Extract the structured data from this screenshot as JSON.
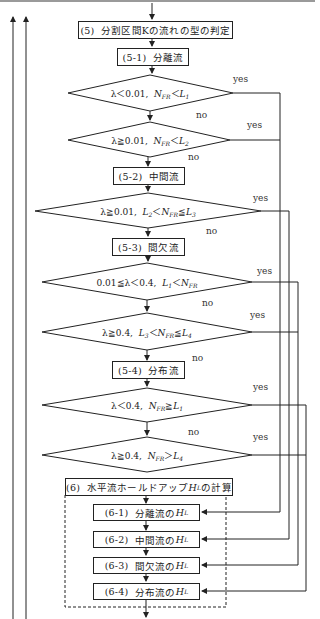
{
  "title_box": {
    "num": "(5)",
    "label": "分割区間Kの流れの型の判定"
  },
  "steps": {
    "s5_1": {
      "num": "(5-1)",
      "label": "分離流"
    },
    "s5_2": {
      "num": "(5-2)",
      "label": "中間流"
    },
    "s5_3": {
      "num": "(5-3)",
      "label": "間欠流"
    },
    "s5_4": {
      "num": "(5-4)",
      "label": "分布流"
    }
  },
  "decisions": [
    {
      "id": "d1",
      "text": "λ＜0.01,  N_FR＜L_1",
      "pre": "λ＜0.01,",
      "var1": "N",
      "sub1": "FR",
      "op": "＜",
      "var2": "L",
      "sub2": "1",
      "yes": "yes",
      "no": "no"
    },
    {
      "id": "d2",
      "text": "λ≧0.01,  N_FR＜L_2",
      "pre": "λ≧0.01,",
      "var1": "N",
      "sub1": "FR",
      "op": "＜",
      "var2": "L",
      "sub2": "2",
      "yes": "yes",
      "no": "no"
    },
    {
      "id": "d3",
      "text": "λ≧0.01,  L_2＜N_FR≦L_3",
      "pre": "λ≧0.01,",
      "var1": "L",
      "sub1": "2",
      "op": "＜",
      "var2": "N",
      "sub2": "FR",
      "op2": "≦",
      "var3": "L",
      "sub3": "3",
      "yes": "yes",
      "no": "no"
    },
    {
      "id": "d4",
      "text": "0.01≦λ＜0.4,  L_1＜N_FR",
      "pre": "0.01≦λ＜0.4,",
      "var1": "L",
      "sub1": "1",
      "op": "＜",
      "var2": "N",
      "sub2": "FR",
      "yes": "yes",
      "no": "no"
    },
    {
      "id": "d5",
      "text": "λ≧0.4,  L_3＜N_FR≦L_4",
      "pre": "λ≧0.4,",
      "var1": "L",
      "sub1": "3",
      "op": "＜",
      "var2": "N",
      "sub2": "FR",
      "op2": "≦",
      "var3": "L",
      "sub3": "4",
      "yes": "yes",
      "no": "no"
    },
    {
      "id": "d6",
      "text": "λ＜0.4,  N_FR≧L_1",
      "pre": "λ＜0.4,",
      "var1": "N",
      "sub1": "FR",
      "op": "≧",
      "var2": "L",
      "sub2": "1",
      "yes": "yes",
      "no": "no"
    },
    {
      "id": "d7",
      "text": "λ≧0.4,  N_FR＞L_4",
      "pre": "λ≧0.4,",
      "var1": "N",
      "sub1": "FR",
      "op": "＞",
      "var2": "L",
      "sub2": "4",
      "yes": "yes"
    }
  ],
  "calc_box": {
    "num": "(6)",
    "label_pre": "水平流ホールドアップ",
    "var": "H",
    "sub": "L",
    "label_post": "の計算"
  },
  "calc_steps": [
    {
      "num": "(6-1)",
      "label": "分離流の",
      "var": "H",
      "sub": "L"
    },
    {
      "num": "(6-2)",
      "label": "中間流の",
      "var": "H",
      "sub": "L"
    },
    {
      "num": "(6-3)",
      "label": "間欠流の",
      "var": "H",
      "sub": "L"
    },
    {
      "num": "(6-4)",
      "label": "分布流の",
      "var": "H",
      "sub": "L"
    }
  ],
  "colors": {
    "line": "#222222",
    "background": "#ffffff"
  }
}
